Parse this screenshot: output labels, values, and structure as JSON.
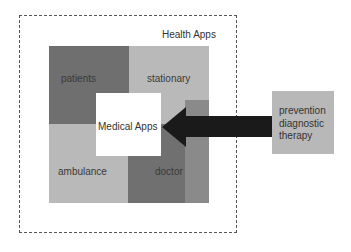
{
  "outer": {
    "title": "Health Apps"
  },
  "blocks": {
    "patients": "patients",
    "stationary": "stationary",
    "ambulance": "ambulance",
    "doctor": "doctor"
  },
  "center": {
    "label": "Medical Apps"
  },
  "external": {
    "lines": [
      "prevention",
      "diagnostic",
      "therapy"
    ]
  },
  "colors": {
    "dark_block": "#6f6f6f",
    "light_block": "#b9b9b9",
    "arrow": "#1a1a1a",
    "external_box": "#b8b8b8"
  }
}
